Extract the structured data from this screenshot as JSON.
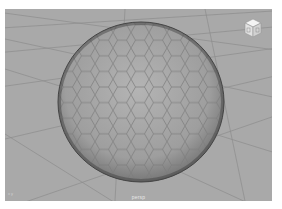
{
  "viewport": {
    "camera_label": "persp",
    "background_color": "#a9a9a9",
    "grid_color": "#8a8a8a",
    "object": {
      "type": "hexagon-tiled sphere",
      "fill_color": "#a4a4a4",
      "outline_color": "#505050"
    },
    "view_cube": {
      "icon": "view-cube-icon"
    },
    "axis_indicator": {
      "icon": "axis-icon",
      "label": "x y"
    }
  }
}
